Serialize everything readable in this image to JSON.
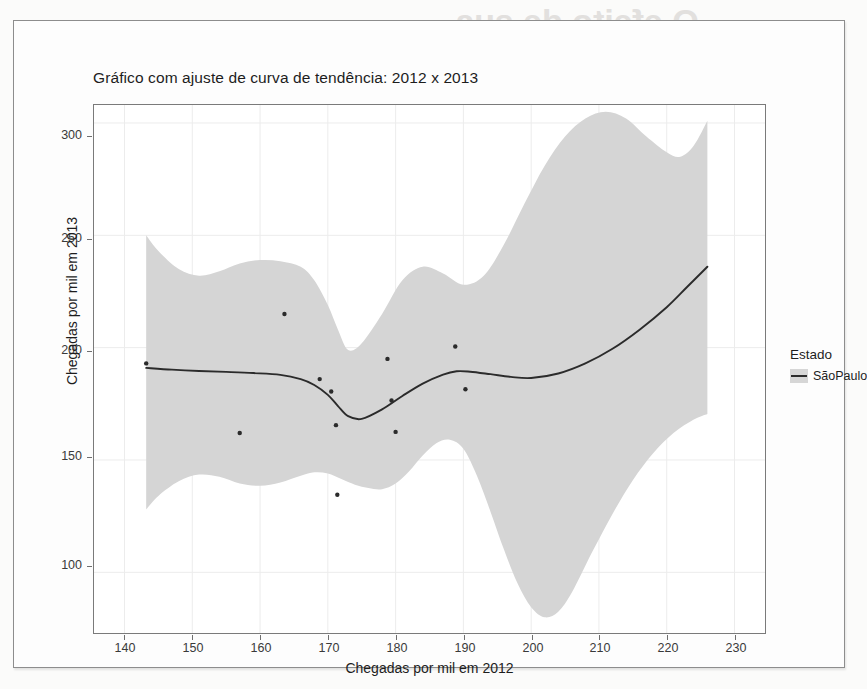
{
  "figure": {
    "title": "Gráfico com ajuste de curva de tendência: 2012 x 2013",
    "bleed_through_line1": "O efeito de sua",
    "bleed_through_line2": "singular"
  },
  "legend": {
    "title": "Estado",
    "entries": [
      "SãoPaulo"
    ]
  },
  "colors": {
    "point": "#2b2b2b",
    "line": "#2b2b2b",
    "ribbon": "#d5d5d5",
    "panel_border": "#7a7a7a",
    "grid": "#ececec",
    "text": "#1d1d1d"
  },
  "chart_data": {
    "type": "scatter",
    "title": "Gráfico com ajuste de curva de tendência: 2012 x 2013",
    "xlabel": "Chegadas por mil em 2012",
    "ylabel": "Chegadas por mil em 2013",
    "xlim": [
      135.5,
      234.5
    ],
    "ylim": [
      73,
      308
    ],
    "xticks": [
      140,
      150,
      160,
      170,
      180,
      190,
      200,
      210,
      220,
      230
    ],
    "yticks": [
      100,
      150,
      200,
      250,
      300
    ],
    "grid": true,
    "legend_position": "right",
    "series": [
      {
        "name": "SãoPaulo",
        "kind": "points",
        "x": [
          143.2,
          157.0,
          163.6,
          168.8,
          170.5,
          171.2,
          171.4,
          178.8,
          179.4,
          180.0,
          188.8,
          190.3
        ],
        "y": [
          193.0,
          162.0,
          215.0,
          186.0,
          180.5,
          165.5,
          134.5,
          195.0,
          176.5,
          162.5,
          200.5,
          181.5
        ]
      },
      {
        "name": "loess fit",
        "kind": "line",
        "x": [
          143.2,
          147,
          151,
          155,
          159,
          163,
          166,
          168,
          170,
          171.5,
          173,
          175,
          178,
          181,
          184,
          187,
          189,
          191,
          194,
          197,
          200,
          204,
          208,
          212,
          216,
          220,
          223,
          226.0
        ],
        "y": [
          191.0,
          190.2,
          189.6,
          189.2,
          188.7,
          187.9,
          186.0,
          183.4,
          179.0,
          174.0,
          169.5,
          168.3,
          172.5,
          178.5,
          184.0,
          188.0,
          189.5,
          189.3,
          188.2,
          187.0,
          186.5,
          188.5,
          193.0,
          199.5,
          208.0,
          218.0,
          227.0,
          236.0
        ]
      },
      {
        "name": "confidence ribbon upper",
        "kind": "ribbon_upper",
        "x": [
          143.2,
          145,
          148,
          151,
          154,
          157,
          160,
          163,
          166,
          168,
          170,
          171.5,
          173,
          175,
          178,
          181,
          184,
          187,
          190,
          193,
          196,
          199,
          202,
          205,
          208,
          211,
          214,
          217,
          220,
          222,
          224,
          226.0
        ],
        "y": [
          250.0,
          243.0,
          235.0,
          232.0,
          234.0,
          237.5,
          239.0,
          238.5,
          236.0,
          230.0,
          219.0,
          208.0,
          199.0,
          202.0,
          215.0,
          230.0,
          236.0,
          233.0,
          228.0,
          232.0,
          246.0,
          264.0,
          281.0,
          294.0,
          302.0,
          305.0,
          302.0,
          294.0,
          287.0,
          285.0,
          290.0,
          301.0
        ]
      },
      {
        "name": "confidence ribbon lower",
        "kind": "ribbon_lower",
        "x": [
          143.2,
          145,
          148,
          151,
          154,
          157,
          160,
          163,
          166,
          168,
          170,
          172,
          174,
          176,
          178,
          180,
          182,
          184,
          186,
          188,
          190,
          192,
          194,
          196,
          198,
          200,
          202,
          204,
          206,
          209,
          212,
          215,
          218,
          221,
          224,
          226.0
        ],
        "y": [
          128.0,
          134.0,
          140.5,
          143.5,
          142.5,
          139.5,
          138.5,
          140.0,
          143.0,
          144.5,
          144.0,
          141.5,
          139.0,
          137.5,
          137.0,
          139.5,
          145.0,
          152.0,
          157.5,
          159.0,
          155.0,
          143.0,
          127.0,
          110.0,
          95.0,
          84.5,
          80.0,
          82.5,
          91.0,
          109.0,
          126.0,
          141.0,
          153.0,
          162.0,
          168.0,
          170.5
        ]
      }
    ]
  }
}
